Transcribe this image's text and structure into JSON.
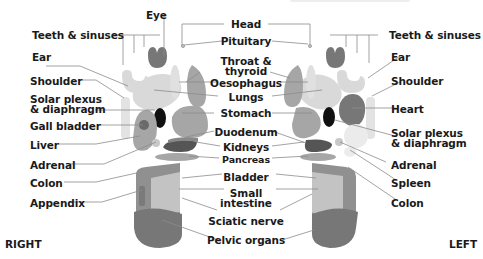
{
  "title_fragment_faded": "",
  "colors": {
    "light": "#d9d9d9",
    "mid": "#a6a6a6",
    "dark": "#777777",
    "darker": "#5a5a5a",
    "black": "#111111",
    "line": "#8c8c8c"
  },
  "sides": {
    "right": "RIGHT",
    "left": "LEFT"
  },
  "center_labels": {
    "head": "Head",
    "pituitary": "Pituitary",
    "throat_1": "Throat &",
    "throat_2": "thyroid",
    "oesophagus": "Oesophagus",
    "lungs": "Lungs",
    "stomach": "Stomach",
    "duodenum": "Duodenum",
    "kidneys": "Kidneys",
    "pancreas": "Pancreas",
    "bladder": "Bladder",
    "small_intestine_1": "Small",
    "small_intestine_2": "intestine",
    "sciatic_nerve": "Sciatic nerve",
    "pelvic_organs": "Pelvic organs"
  },
  "right_foot_labels": {
    "eye": "Eye",
    "teeth": "Teeth & sinuses",
    "ear": "Ear",
    "shoulder": "Shoulder",
    "solar_1": "Solar plexus",
    "solar_2": "& diaphragm",
    "gall_bladder": "Gall bladder",
    "liver": "Liver",
    "adrenal": "Adrenal",
    "colon": "Colon",
    "appendix": "Appendix"
  },
  "left_foot_labels": {
    "teeth": "Teeth & sinuses",
    "ear": "Ear",
    "shoulder": "Shoulder",
    "heart": "Heart",
    "solar_1": "Solar plexus",
    "solar_2": "& diaphragm",
    "adrenal": "Adrenal",
    "spleen": "Spleen",
    "colon": "Colon"
  }
}
